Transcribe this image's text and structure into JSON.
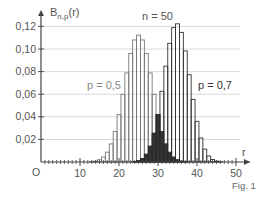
{
  "chart_data": {
    "type": "bar",
    "title": "n = 50",
    "xlabel": "r",
    "ylabel": "B_{n,p}(r)",
    "origin_label": "O",
    "figure_label": "Fig. 1",
    "xlim": [
      0,
      50
    ],
    "ylim": [
      0,
      0.125
    ],
    "x_ticks": [
      10,
      20,
      30,
      40,
      50
    ],
    "y_ticks": [
      0.02,
      0.04,
      0.06,
      0.08,
      0.1,
      0.12
    ],
    "y_tick_labels": [
      "0,02",
      "0,04",
      "0,06",
      "0,08",
      "0,10",
      "0,12"
    ],
    "grid": "horizontal",
    "overlap_fill": "#333333",
    "series": [
      {
        "name": "p = 0,5",
        "label_color": "#888888",
        "bar_stroke": "#777777",
        "x": [
          13,
          14,
          15,
          16,
          17,
          18,
          19,
          20,
          21,
          22,
          23,
          24,
          25,
          26,
          27,
          28,
          29,
          30,
          31,
          32,
          33,
          34,
          35,
          36,
          37
        ],
        "values": [
          0.0003,
          0.0008,
          0.002,
          0.0044,
          0.0087,
          0.016,
          0.027,
          0.0419,
          0.0598,
          0.0788,
          0.096,
          0.108,
          0.1123,
          0.108,
          0.096,
          0.0788,
          0.0598,
          0.0419,
          0.027,
          0.016,
          0.0087,
          0.0044,
          0.002,
          0.0008,
          0.0003
        ]
      },
      {
        "name": "p = 0,7",
        "label_color": "#333333",
        "bar_stroke": "#333333",
        "x": [
          24,
          25,
          26,
          27,
          28,
          29,
          30,
          31,
          32,
          33,
          34,
          35,
          36,
          37,
          38,
          39,
          40,
          41,
          42,
          43,
          44,
          45,
          46
        ],
        "values": [
          0.0004,
          0.0012,
          0.0031,
          0.0069,
          0.014,
          0.0255,
          0.0419,
          0.0626,
          0.0848,
          0.105,
          0.1189,
          0.1223,
          0.1147,
          0.0983,
          0.0772,
          0.0554,
          0.036,
          0.0213,
          0.0114,
          0.0053,
          0.0022,
          0.0008,
          0.0002
        ]
      }
    ],
    "annotations": [
      {
        "text": "n = 50"
      },
      {
        "text": "p = 0,5"
      },
      {
        "text": "p = 0,7"
      }
    ]
  }
}
